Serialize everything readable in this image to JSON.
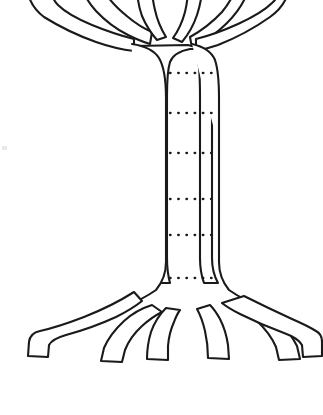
{
  "document": {
    "title": "Tree Diagram Template",
    "background_color": "#ffffff",
    "ink_color": "#1a1a1a",
    "width": 323,
    "height": 415
  },
  "figure": {
    "name": "tree-outline-drawing",
    "style": "black line art, white fill, hand-drawn outline",
    "parts": [
      {
        "id": "canopy",
        "label": "branches",
        "note": "upper branches, cropped by the top edge of the image"
      },
      {
        "id": "trunk",
        "label": "trunk",
        "note": "vertical trunk spanning roughly y=55 to y=290"
      },
      {
        "id": "roots",
        "label": "roots",
        "note": "five spreading roots along the bottom"
      }
    ]
  },
  "trunk": {
    "left_edge_x": 167,
    "right_edge_x": 218,
    "top_y": 55,
    "bottom_y": 290,
    "dotted_line_color": "#1a1a1a",
    "dotted_line_count": 6,
    "dotted_lines": [
      {
        "index": 1,
        "y": 73,
        "x_start": 170,
        "x_end": 216
      },
      {
        "index": 2,
        "y": 113,
        "x_start": 170,
        "x_end": 216
      },
      {
        "index": 3,
        "y": 153,
        "x_start": 170,
        "x_end": 216
      },
      {
        "index": 4,
        "y": 199,
        "x_start": 170,
        "x_end": 216
      },
      {
        "index": 5,
        "y": 235,
        "x_start": 170,
        "x_end": 216
      },
      {
        "index": 6,
        "y": 278,
        "x_start": 170,
        "x_end": 216
      }
    ]
  },
  "branches": {
    "count": 6,
    "note": "three branches fan to the left, three fan to the right; tips run off the top of the frame"
  },
  "roots": {
    "count": 5,
    "note": "roots splay outward and downward, tapering to blunt tips near y=370"
  },
  "paths": {
    "outline": "M 12 354 L 14 340 Q 16 333 26 331 Q 52 328 82 315 Q 112 302 136 290 Q 152 282 160 268 L 160 120 Q 160 80 157 66 Q 153 55 140 52 Q 118 50 96 41 Q 70 31 44 16 Q 33 9 30 -2 L 56 -4 Q 60 7 76 15 Q 98 26 120 32 Q 104 20 93 6 Q 86 -3 84 -10 L 108 -12 Q 114 0 128 12 Q 140 22 152 28 Q 144 14 140 0 L 139 -14 L 162 -14 L 164 4 Q 168 20 176 31 Q 182 20 186 2 L 188 -14 L 210 -14 L 209 2 Q 206 17 199 30 Q 212 22 223 10 Q 232 0 236 -12 L 259 -10 Q 254 3 244 14 Q 234 25 222 34 Q 244 27 264 16 Q 280 7 285 -4 L 310 -2 Q 306 10 293 19 Q 268 36 240 46 Q 224 51 212 53 Q 200 56 197 67 Q 194 80 194 120 L 194 268 Q 200 281 216 290 Q 240 302 268 314 Q 296 326 312 330 Q 320 332 321 340 L 322 354 L 298 356 L 297 344 Q 292 337 276 332 Q 254 325 232 315 Q 246 328 254 342 Q 260 352 260 360 L 237 361 L 234 348 Q 228 334 216 323 Q 208 316 200 312 Q 206 326 209 342 L 210 359 L 187 360 L 186 344 Q 183 328 176 317 Q 169 328 166 344 L 165 360 L 142 359 L 143 342 Q 146 326 152 312 Q 143 316 135 324 Q 124 335 119 348 L 116 361 L 93 360 Q 93 352 99 342 Q 107 328 121 315 Q 99 325 77 332 Q 61 337 56 344 L 55 356 Z"
  }
}
